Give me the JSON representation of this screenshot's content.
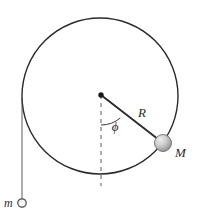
{
  "figure": {
    "background_color": "#ffffff",
    "stroke_color": "#2b2b2b",
    "labels": {
      "radius": "R",
      "angle": "ϕ",
      "mass_on_hoop": "M",
      "hanging_mass": "m"
    },
    "geometry": {
      "hoop": {
        "center_x": 100,
        "center_y": 96,
        "radius": 78,
        "stroke_width": 1.4
      },
      "center_dot": {
        "x": 101,
        "y": 95,
        "radius": 2.6
      },
      "radius_line": {
        "angle_from_vertical_deg": 40,
        "from_x": 101,
        "from_y": 95,
        "to_x": 163,
        "to_y": 143,
        "stroke_width": 1.8
      },
      "dashed_vertical": {
        "x": 101,
        "from_y": 95,
        "to_y": 186,
        "dash": "4 4"
      },
      "angle_arc": {
        "radius": 30,
        "start_deg": 90,
        "sweep_deg": 40
      },
      "mass_M_sphere": {
        "x": 163,
        "y": 143,
        "radius": 8.5,
        "fill_light": "#e9e9e9",
        "fill_mid": "#bdbdbd",
        "fill_dark": "#8f8f8f"
      },
      "string": {
        "x": 22,
        "from_y": 98,
        "to_y": 199,
        "stroke_width": 0.9
      },
      "mass_m_circle": {
        "x": 22,
        "y": 203,
        "radius": 4.2,
        "fill": "#f4f4f4",
        "stroke_width": 1.2
      }
    },
    "label_positions": {
      "radius": {
        "x": 142,
        "y": 117
      },
      "angle": {
        "x": 115,
        "y": 131
      },
      "mass_on_hoop": {
        "x": 175,
        "y": 157
      },
      "hanging_mass": {
        "x": 6,
        "y": 207
      }
    },
    "label_sizes": {
      "radius": 13,
      "angle": 13,
      "mass_on_hoop": 13,
      "hanging_mass": 12
    }
  }
}
